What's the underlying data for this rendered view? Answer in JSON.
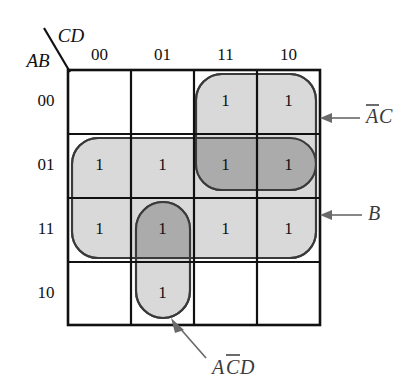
{
  "diagram": {
    "type": "karnaugh-map",
    "title": "",
    "variables": {
      "row_label": "AB",
      "col_label": "CD"
    },
    "col_headers": [
      "00",
      "01",
      "11",
      "10"
    ],
    "row_headers": [
      "00",
      "01",
      "11",
      "10"
    ],
    "cell_value": "1",
    "cells": [
      {
        "row": "00",
        "col": "00",
        "value": ""
      },
      {
        "row": "00",
        "col": "01",
        "value": ""
      },
      {
        "row": "00",
        "col": "11",
        "value": "1"
      },
      {
        "row": "00",
        "col": "10",
        "value": "1"
      },
      {
        "row": "01",
        "col": "00",
        "value": "1"
      },
      {
        "row": "01",
        "col": "01",
        "value": "1"
      },
      {
        "row": "01",
        "col": "11",
        "value": "1"
      },
      {
        "row": "01",
        "col": "10",
        "value": "1"
      },
      {
        "row": "11",
        "col": "00",
        "value": "1"
      },
      {
        "row": "11",
        "col": "01",
        "value": "1"
      },
      {
        "row": "11",
        "col": "11",
        "value": "1"
      },
      {
        "row": "11",
        "col": "10",
        "value": "1"
      },
      {
        "row": "10",
        "col": "00",
        "value": ""
      },
      {
        "row": "10",
        "col": "01",
        "value": "1"
      },
      {
        "row": "10",
        "col": "11",
        "value": ""
      },
      {
        "row": "10",
        "col": "10",
        "value": ""
      }
    ],
    "groups": [
      {
        "id": "group-ac",
        "label_plain": "AC",
        "label_parts": [
          {
            "text": "A",
            "overbar": true
          },
          {
            "text": "C",
            "overbar": false
          }
        ],
        "covers_rows": [
          "00",
          "01"
        ],
        "covers_cols": [
          "11",
          "10"
        ]
      },
      {
        "id": "group-b",
        "label_plain": "B",
        "label_parts": [
          {
            "text": "B",
            "overbar": false
          }
        ],
        "covers_rows": [
          "01",
          "11"
        ],
        "covers_cols": [
          "00",
          "01",
          "11",
          "10"
        ]
      },
      {
        "id": "group-acd",
        "label_plain": "ACD",
        "label_parts": [
          {
            "text": "A",
            "overbar": false
          },
          {
            "text": "C",
            "overbar": true
          },
          {
            "text": "D",
            "overbar": false
          }
        ],
        "covers_rows": [
          "11",
          "10"
        ],
        "covers_cols": [
          "01"
        ]
      }
    ],
    "colors": {
      "group_fill": "#d9d9d9",
      "group_overlap_fill": "#ababab",
      "group_stroke": "#3a3a3a",
      "grid_stroke": "#111111",
      "leader_stroke": "#6a6a6a",
      "label_color": "#3b3b3b",
      "background": "#ffffff"
    }
  }
}
